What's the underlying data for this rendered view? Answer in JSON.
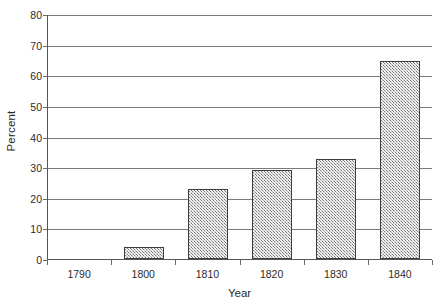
{
  "chart_data": {
    "type": "bar",
    "title": "",
    "xlabel": "Year",
    "ylabel": "Percent",
    "categories": [
      "1790",
      "1800",
      "1810",
      "1820",
      "1830",
      "1840"
    ],
    "values": [
      0,
      4,
      23,
      29,
      32.5,
      64.5
    ],
    "ylim": [
      0,
      80
    ],
    "yticks": [
      0,
      10,
      20,
      30,
      40,
      50,
      60,
      70,
      80
    ],
    "ytick_labels": [
      "0",
      "10",
      "20",
      "30",
      "40",
      "50",
      "60",
      "70",
      "80"
    ],
    "grid": true,
    "grid_axis": "y",
    "legend": false,
    "legend_position": "none",
    "bar_fill": "#b8b8b8",
    "bar_pattern": "diagonal-hatch",
    "bar_edge_color": "#3d3d3d",
    "axis_color": "#555555",
    "gridline_color": "#7a7a7a",
    "background": "#ffffff",
    "series": [
      {
        "name": "Percent",
        "values": [
          0,
          4,
          23,
          29,
          32.5,
          64.5
        ]
      }
    ]
  }
}
